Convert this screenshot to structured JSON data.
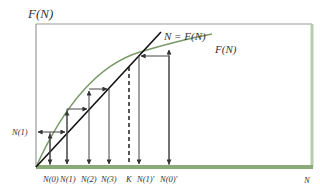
{
  "figure": {
    "y_axis_label": "F(N)",
    "x_axis_label": "N",
    "diagonal_label": "N = F(N)",
    "curve_label": "F(N)",
    "left_label": "N(1)",
    "x_tick_labels": [
      "N(0)",
      "N(1)",
      "N(2)",
      "N(3)",
      "K",
      "N(1)'",
      "N(0)'"
    ]
  },
  "colors": {
    "curve": "#7a9a6a",
    "baseline": "#8aab78",
    "frame": "#9a9a9a",
    "diagonal": "#111111",
    "arrows": "#555555"
  }
}
